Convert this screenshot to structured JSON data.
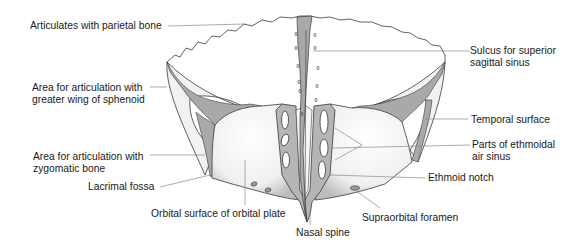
{
  "figure": {
    "colors": {
      "background": "#ffffff",
      "bone_surface": "#f4f4f4",
      "articular_area": "#a9a9a9",
      "outline": "#3a3a3a",
      "leader_line": "#8a8a8a",
      "text": "#1a1a1a"
    }
  },
  "labels": {
    "parietal": "Articulates with parietal bone",
    "sphenoid_line1": "Area for articulation with",
    "sphenoid_line2": "greater wing of sphenoid",
    "zygomatic_line1": "Area for articulation with",
    "zygomatic_line2": "zygomatic bone",
    "lacrimal": "Lacrimal fossa",
    "orbital": "Orbital surface of orbital plate",
    "nasal": "Nasal spine",
    "supraorbital": "Supraorbital foramen",
    "ethmoid_notch": "Ethmoid notch",
    "ethmoidal_line1": "Parts of ethmoidal",
    "ethmoidal_line2": "air sinus",
    "temporal": "Temporal surface",
    "sulcus_line1": "Sulcus for superior",
    "sulcus_line2": "sagittal sinus"
  }
}
